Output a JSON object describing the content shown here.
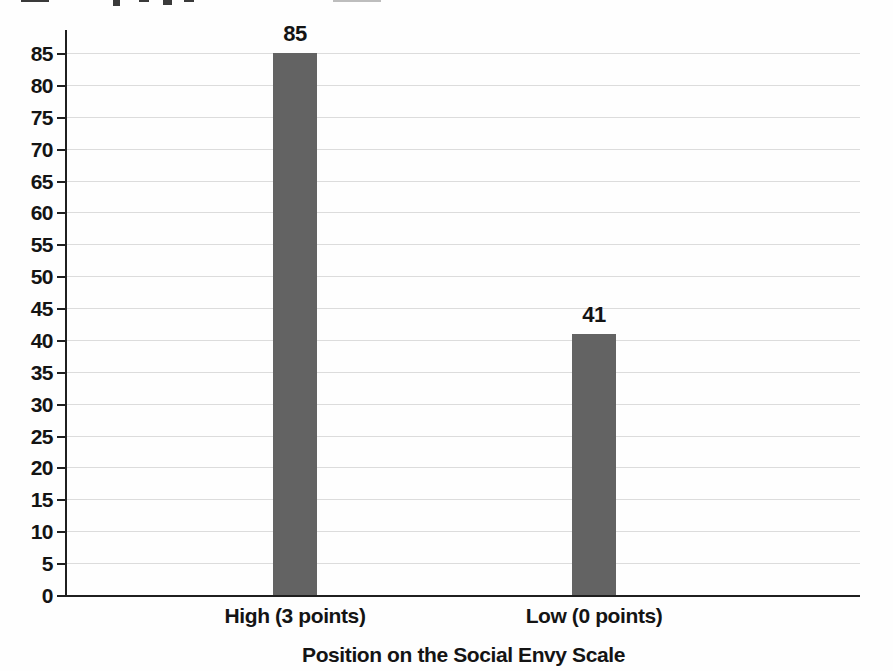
{
  "chart_data": {
    "type": "bar",
    "title": "",
    "categories": [
      "High (3 points)",
      "Low (0 points)"
    ],
    "values": [
      85,
      41
    ],
    "bar_value_labels": [
      "85",
      "41"
    ],
    "xlabel": "Position on the Social Envy Scale",
    "ylabel": "",
    "ylim": [
      0,
      85
    ],
    "y_ticks": [
      0,
      5,
      10,
      15,
      20,
      25,
      30,
      35,
      40,
      45,
      50,
      55,
      60,
      65,
      70,
      75,
      80,
      85
    ],
    "grid": "horizontal",
    "legend": "none",
    "colors": {
      "bar_fill": "#5e5e5e",
      "axis": "#1f1f1f",
      "gridline": "#dcdcdc",
      "text": "#141414",
      "background": "#fefefe"
    }
  }
}
